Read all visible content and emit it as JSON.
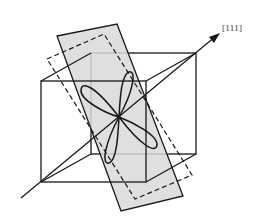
{
  "figure": {
    "axis_label": "[111]",
    "colors": {
      "line": "#1a1a1a",
      "plane_fill": "#d9d9d9",
      "background": "#ffffff"
    },
    "elements": [
      "cube",
      "shaded-plane",
      "dashed-plane-outline",
      "four-lobe-orbital",
      "111-axis-arrow"
    ]
  }
}
